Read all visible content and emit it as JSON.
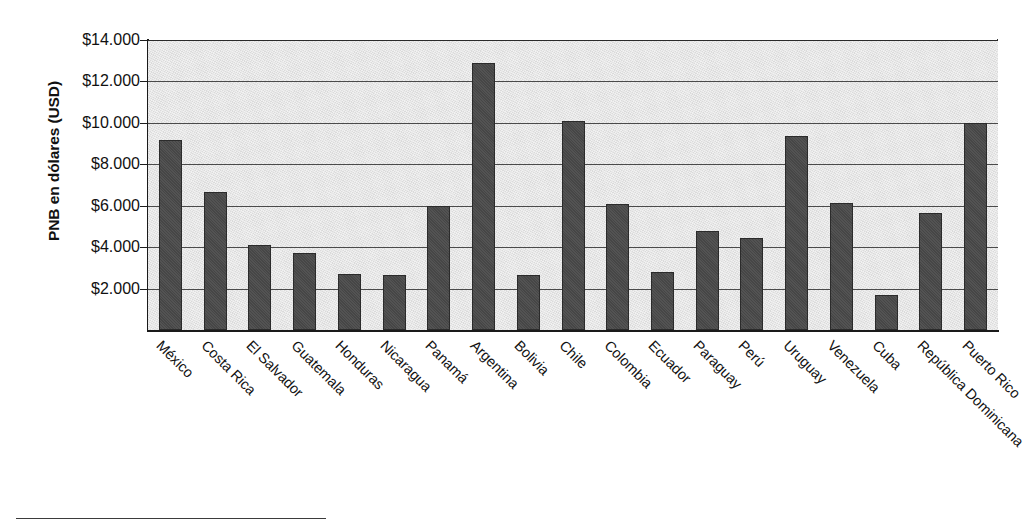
{
  "chart_data": {
    "type": "bar",
    "title": "",
    "xlabel": "",
    "ylabel": "PNB en dólares (USD)",
    "ylim": [
      0,
      14000
    ],
    "grid": true,
    "legend": null,
    "tick_labels": [
      "$2.000",
      "$4.000",
      "$6.000",
      "$8.000",
      "$10.000",
      "$12.000",
      "$14.000"
    ],
    "tick_values": [
      2000,
      4000,
      6000,
      8000,
      10000,
      12000,
      14000
    ],
    "categories": [
      "México",
      "Costa Rica",
      "El Salvador",
      "Guatemala",
      "Honduras",
      "Nicaragua",
      "Panamá",
      "Argentina",
      "Bolivia",
      "Chile",
      "Colombia",
      "Ecuador",
      "Paraguay",
      "Perú",
      "Uruguay",
      "Venezuela",
      "Cuba",
      "República Dominicana",
      "Puerto Rico"
    ],
    "values": [
      9150,
      6650,
      4100,
      3700,
      2700,
      2650,
      6000,
      12900,
      2650,
      10100,
      6100,
      2800,
      4800,
      4450,
      9350,
      6150,
      1700,
      5650,
      10000
    ],
    "colors": {
      "bar_fill": "#4a4a4a",
      "bar_stroke": "#2b2b2b",
      "plot_background": "#e2e2e2",
      "gridline": "#4a4a4a",
      "axis": "#1a1a1a",
      "text": "#111111"
    }
  }
}
